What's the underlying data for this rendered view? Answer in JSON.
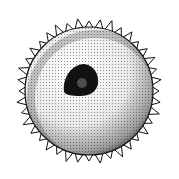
{
  "image": {
    "subject": "stippled illustration of spherical spore/pollen grain with spiny outer wall and dark central nucleus",
    "width": 179,
    "height": 179,
    "background": "#ffffff",
    "ink": "#111111",
    "sphere": {
      "cx": 89,
      "cy": 91,
      "r": 66
    },
    "nucleus": {
      "cx": 82,
      "cy": 79,
      "rx": 14,
      "ry": 12
    },
    "spines": 40
  }
}
